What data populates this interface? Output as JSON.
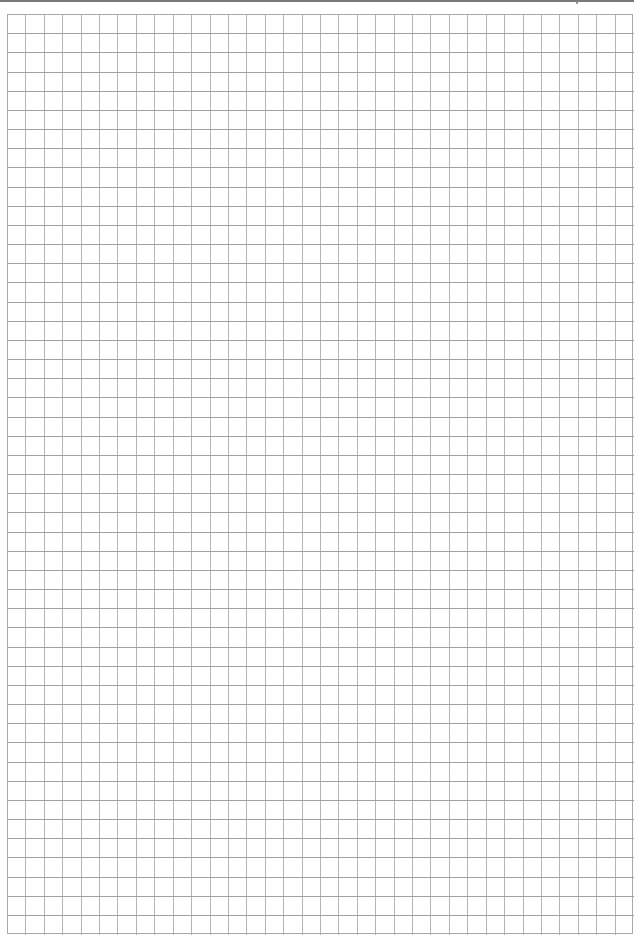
{
  "page": {
    "type": "blank-grid-paper",
    "width": 638,
    "height": 937,
    "background_color": "#ffffff"
  },
  "header_rule": {
    "color": "#7a7a7a"
  },
  "grid": {
    "left": 7,
    "top": 14,
    "right": 633,
    "bottom": 934,
    "columns": 34,
    "rows": 48,
    "vertical_line_color": "#b4b4b4",
    "horizontal_line_color": "#a0a0a0",
    "border_color": "#a9a9a9"
  }
}
